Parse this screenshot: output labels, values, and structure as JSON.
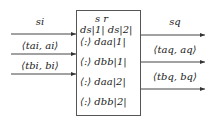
{
  "inputs": [
    {
      "label": "si"
    },
    {
      "label": "⟨tai, ai⟩"
    },
    {
      "label": "⟨tbi, bi⟩"
    }
  ],
  "outputs": [
    {
      "label": "sq"
    },
    {
      "label": "⟨taq, aq⟩"
    },
    {
      "label": "⟨tbq, bq⟩"
    }
  ],
  "box": {
    "header": "s   r",
    "rows": [
      "ds|1| ds|2|",
      "⟨:⟩ daa|1|",
      "⟨:⟩ dbb|1|",
      "⟨:⟩ daa|2|",
      "⟨:⟩ dbb|2|"
    ]
  }
}
